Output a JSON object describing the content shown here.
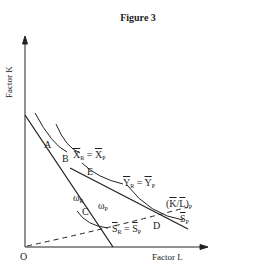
{
  "figure": {
    "title": "Figure 3",
    "axes": {
      "ylabel": "Factor K",
      "xlabel": "Factor L",
      "origin": "O"
    },
    "points": [
      "A",
      "B",
      "C",
      "D",
      "E"
    ],
    "wage_labels": {
      "omega_R": "ω",
      "omega_R_sub": "R",
      "omega_P": "ω",
      "omega_P_sub": "P"
    },
    "isoquants": {
      "X": {
        "left": "X",
        "left_sub": "R",
        "eq": " = ",
        "right": "X",
        "right_sub": "P"
      },
      "Y": {
        "left": "Y",
        "left_sub": "R",
        "eq": " = ",
        "right": "Y",
        "right_sub": "P"
      },
      "S": {
        "left": "S",
        "left_sub": "R",
        "eq": " = ",
        "right": "S",
        "right_sub": "P"
      },
      "SP": {
        "label": "S",
        "sub": "P"
      }
    },
    "ray": {
      "open": "(",
      "k": "K",
      "slash": "/",
      "l": "L",
      "close": ")",
      "sub": "P"
    }
  }
}
